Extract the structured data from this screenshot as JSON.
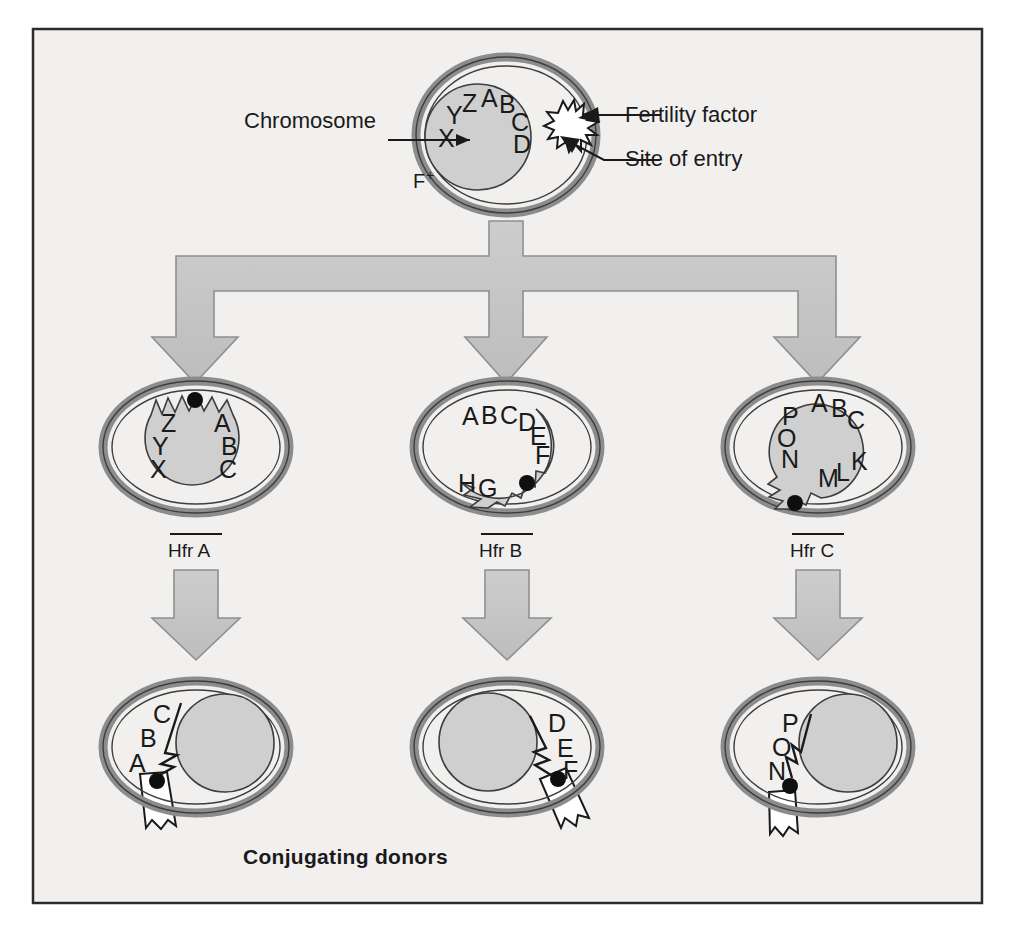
{
  "figure": {
    "title": "Conjugating donors",
    "caption": "Conjugating donors",
    "background_color": "#f1f0ee",
    "border_color": "#2b2b2b",
    "cell_wall_color": "#8c8c8c",
    "nucleus_fill": "#cfcfcf",
    "arrow_fill": "#c6c6c6",
    "arrow_stroke": "#8f8f8f",
    "ink_color": "#1a1a1a"
  },
  "callouts": {
    "chromosome": "Chromosome",
    "fertility_factor": "Fertility factor",
    "site_of_entry": "Site of entry"
  },
  "parent_cell": {
    "strain_label": "F",
    "strain_superscript": "+",
    "genes": [
      "X",
      "Y",
      "Z",
      "A",
      "B",
      "C",
      "D"
    ],
    "has_fertility_factor": true,
    "has_site_of_entry": true
  },
  "hfr_cells": [
    {
      "label": "Hfr A",
      "genes_left": [
        "Z",
        "Y",
        "X"
      ],
      "genes_right": [
        "A",
        "B",
        "C"
      ],
      "integration_site": "top"
    },
    {
      "label": "Hfr B",
      "genes_top": [
        "A",
        "B",
        "C",
        "D",
        "E",
        "F"
      ],
      "genes_bottom": [
        "H",
        "G"
      ],
      "integration_site": "bottom-right"
    },
    {
      "label": "Hfr C",
      "genes_left": [
        "P",
        "O",
        "N"
      ],
      "genes_top": [
        "A",
        "B",
        "C"
      ],
      "genes_right": [
        "M",
        "L",
        "K"
      ],
      "integration_site": "bottom-left"
    }
  ],
  "donor_cells": [
    {
      "genes": [
        "C",
        "B",
        "A"
      ],
      "pilus_position": "bottom-left"
    },
    {
      "genes": [
        "D",
        "E",
        "F"
      ],
      "pilus_position": "bottom-right"
    },
    {
      "genes": [
        "P",
        "O",
        "N"
      ],
      "pilus_position": "bottom-left"
    }
  ],
  "icons": {
    "fertility_factor": "star-burst-icon",
    "origin_dot": "origin-dot-icon",
    "pilus": "pilus-tube-icon",
    "arrow": "down-arrow-icon"
  }
}
